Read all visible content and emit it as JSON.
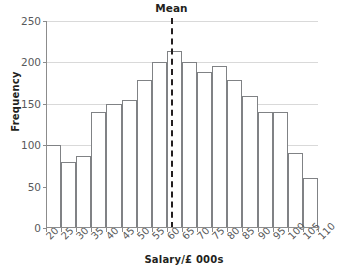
{
  "chart_data": {
    "type": "bar",
    "title": "",
    "xlabel": "Salary/£ 000s",
    "ylabel": "Frequency",
    "grid": true,
    "legend": "none",
    "xlim": [
      20,
      110
    ],
    "ylim": [
      0,
      250
    ],
    "ytick_labels": [
      "0",
      "50",
      "100",
      "150",
      "200",
      "250"
    ],
    "ytick_values": [
      0,
      50,
      100,
      150,
      200,
      250
    ],
    "xtick_labels": [
      "20",
      "25",
      "30",
      "35",
      "40",
      "45",
      "50",
      "55",
      "60",
      "65",
      "70",
      "75",
      "80",
      "85",
      "90",
      "95",
      "100",
      "105",
      "110"
    ],
    "xtick_values": [
      20,
      25,
      30,
      35,
      40,
      45,
      50,
      55,
      60,
      65,
      70,
      75,
      80,
      85,
      90,
      95,
      100,
      105,
      110
    ],
    "bin_width": 5,
    "bins": [
      {
        "start": 20,
        "end": 25,
        "label": "20-25",
        "value": 100
      },
      {
        "start": 25,
        "end": 30,
        "label": "25-30",
        "value": 80
      },
      {
        "start": 30,
        "end": 35,
        "label": "30-35",
        "value": 87
      },
      {
        "start": 35,
        "end": 40,
        "label": "35-40",
        "value": 140
      },
      {
        "start": 40,
        "end": 45,
        "label": "40-45",
        "value": 150
      },
      {
        "start": 45,
        "end": 50,
        "label": "45-50",
        "value": 155
      },
      {
        "start": 50,
        "end": 55,
        "label": "50-55",
        "value": 179
      },
      {
        "start": 55,
        "end": 60,
        "label": "55-60",
        "value": 200
      },
      {
        "start": 60,
        "end": 65,
        "label": "60-65",
        "value": 214
      },
      {
        "start": 65,
        "end": 70,
        "label": "65-70",
        "value": 200
      },
      {
        "start": 70,
        "end": 75,
        "label": "70-75",
        "value": 189
      },
      {
        "start": 75,
        "end": 80,
        "label": "75-80",
        "value": 196
      },
      {
        "start": 80,
        "end": 85,
        "label": "80-85",
        "value": 179
      },
      {
        "start": 85,
        "end": 90,
        "label": "85-90",
        "value": 160
      },
      {
        "start": 90,
        "end": 95,
        "label": "90-95",
        "value": 140
      },
      {
        "start": 95,
        "end": 100,
        "label": "95-100",
        "value": 140
      },
      {
        "start": 100,
        "end": 105,
        "label": "100-105",
        "value": 90
      },
      {
        "start": 105,
        "end": 110,
        "label": "105-110",
        "value": 60
      },
      {
        "start": 110,
        "end": 115,
        "label": "110-115",
        "value": 30
      }
    ],
    "annotations": [
      {
        "name": "mean",
        "label": "Mean",
        "x": 61.5,
        "style": "dashed-vertical-line"
      }
    ],
    "colors": {
      "bar_fill": "#ffffff",
      "bar_edge": "#808285",
      "axis": "#8c8c8c",
      "grid": "#d9d9d9",
      "text": "#231f20",
      "tick_text": "#58595b",
      "mean_line": "#231f20",
      "background": "#ffffff"
    }
  }
}
